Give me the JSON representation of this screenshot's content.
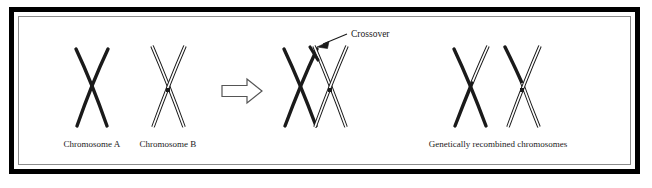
{
  "figure": {
    "background_color": "#ffffff",
    "border": {
      "outer_color": "#000000",
      "inner_color": "#8c8c8c",
      "gap_color": "#ffffff",
      "outer_width": 5,
      "inner_width": 1
    },
    "ink_color": "#1a1a1a",
    "hollow_fill": "#ffffff"
  },
  "labels": {
    "chromosome_a": "Chromosome A",
    "chromosome_b": "Chromosome B",
    "crossover": "Crossover",
    "recombined": "Genetically recombined chromosomes"
  },
  "diagram_data": {
    "type": "process-diagram",
    "stages": [
      {
        "name": "inputs",
        "items": [
          {
            "id": "chromosome-a",
            "label": "Chromosome A",
            "style": "solid",
            "color": "#1a1a1a",
            "shape": "X"
          },
          {
            "id": "chromosome-b",
            "label": "Chromosome B",
            "style": "hollow",
            "color": "#ffffff",
            "outline": "#1a1a1a",
            "shape": "X"
          }
        ]
      },
      {
        "name": "transition",
        "items": [
          {
            "id": "process-arrow",
            "label": "",
            "style": "hollow-arrow",
            "direction": "right"
          }
        ]
      },
      {
        "name": "crossover",
        "items": [
          {
            "id": "overlapped-pair",
            "label": "Crossover",
            "style": "mixed",
            "shape": "XX-overlapping",
            "annotation": "Crossover"
          }
        ]
      },
      {
        "name": "outputs",
        "items": [
          {
            "id": "recombined-1",
            "label": "",
            "style": "mixed",
            "shape": "X"
          },
          {
            "id": "recombined-2",
            "label": "",
            "style": "mixed",
            "shape": "X"
          }
        ],
        "caption": "Genetically recombined chromosomes"
      }
    ]
  }
}
